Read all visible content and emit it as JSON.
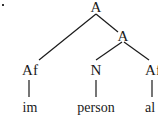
{
  "diagram": {
    "type": "morphological-tree",
    "root": {
      "label": "A",
      "children": [
        {
          "label": "Af",
          "children": [
            {
              "label": "im"
            }
          ]
        },
        {
          "label": "A",
          "children": [
            {
              "label": "N",
              "children": [
                {
                  "label": "person"
                }
              ]
            },
            {
              "label": "Af",
              "children": [
                {
                  "label": "al"
                }
              ]
            }
          ]
        }
      ]
    },
    "nodes": {
      "root": "A",
      "inner_a": "A",
      "af_left": "Af",
      "n": "N",
      "af_right": "Af"
    },
    "leaves": {
      "im": "im",
      "person": "person",
      "al": "al"
    },
    "line_color": "#1a1a1a"
  }
}
